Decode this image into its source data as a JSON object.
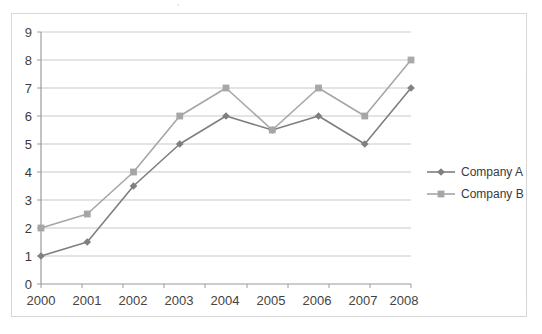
{
  "chart_data": {
    "type": "line",
    "title": "",
    "xlabel": "",
    "ylabel": "",
    "categories": [
      "2000",
      "2001",
      "2002",
      "2003",
      "2004",
      "2005",
      "2006",
      "2007",
      "2008"
    ],
    "series": [
      {
        "name": "Company A",
        "values": [
          1,
          1.5,
          3.5,
          5,
          6,
          5.5,
          6,
          5,
          7
        ],
        "color": "#7f7f7f",
        "marker": "diamond"
      },
      {
        "name": "Company B",
        "values": [
          2,
          2.5,
          4,
          6,
          7,
          5.5,
          7,
          6,
          8
        ],
        "color": "#a6a6a6",
        "marker": "square"
      }
    ],
    "ylim": [
      0,
      9
    ],
    "yticks": [
      "0",
      "1",
      "2",
      "3",
      "4",
      "5",
      "6",
      "7",
      "8",
      "9"
    ],
    "xticks": [
      "2000",
      "2001",
      "2002",
      "2003",
      "2004",
      "2005",
      "2006",
      "2007",
      "2008"
    ],
    "grid": true,
    "grid_axis": "y",
    "grid_color": "#c9c9c9",
    "legend": true,
    "legend_position": "right",
    "legend_entries": [
      "Company A",
      "Company B"
    ],
    "axis_color": "#9a9a9a",
    "text_color": "#3a3a3a",
    "background": "#ffffff",
    "border_color": "#d4d4d4"
  }
}
